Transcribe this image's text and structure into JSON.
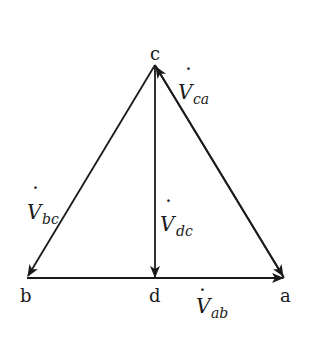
{
  "diagram": {
    "type": "phasor-triangle",
    "points": {
      "a": {
        "label": "a",
        "x": 284,
        "y": 278
      },
      "b": {
        "label": "b",
        "x": 27,
        "y": 278
      },
      "c": {
        "label": "c",
        "x": 155,
        "y": 65
      },
      "d": {
        "label": "d",
        "x": 155,
        "y": 278
      }
    },
    "vectors": [
      {
        "name": "V_ca",
        "from": "a",
        "to": "c",
        "main": "V",
        "sub": "ca",
        "dot": "·"
      },
      {
        "name": "V_bc",
        "from": "c",
        "to": "b",
        "main": "V",
        "sub": "bc",
        "dot": "·"
      },
      {
        "name": "V_dc",
        "from": "c",
        "to": "d",
        "main": "V",
        "sub": "dc",
        "dot": "·"
      },
      {
        "name": "V_ab",
        "from": "b",
        "to": "a",
        "main": "V",
        "sub": "ab",
        "dot": "·"
      }
    ],
    "stroke_color": "#1a1a1a"
  }
}
